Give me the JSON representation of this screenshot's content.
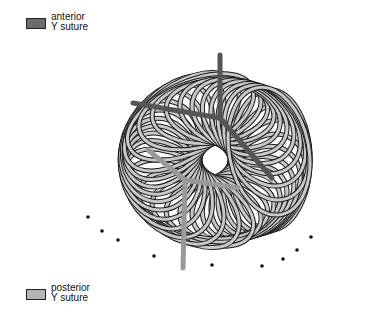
{
  "legend": {
    "anterior": {
      "line1": "anterior",
      "line2": "Y suture",
      "color": "#6b6b6b"
    },
    "posterior": {
      "line1": "posterior",
      "line2": "Y suture",
      "color": "#b4b4b4"
    }
  },
  "diagram": {
    "fiber_fill": "#c8c8c8",
    "fiber_stroke": "#1a1a1a",
    "anterior_suture_color": "#6b6b6b",
    "posterior_suture_color": "#b4b4b4"
  }
}
